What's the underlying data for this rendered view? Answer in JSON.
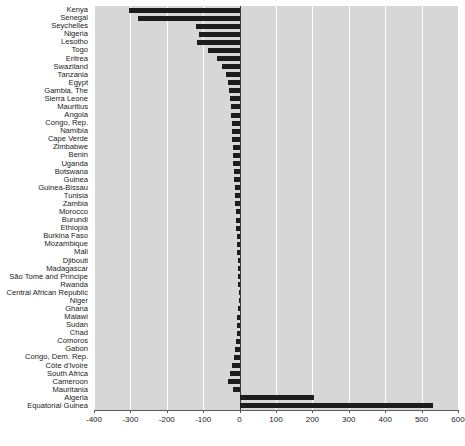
{
  "chart_data": {
    "type": "bar",
    "orientation": "horizontal",
    "title": "",
    "xlabel": "",
    "ylabel": "",
    "xlim": [
      -400,
      600
    ],
    "xticks": [
      -400,
      -300,
      -200,
      -100,
      0,
      100,
      200,
      300,
      400,
      500,
      600
    ],
    "xticklabels": [
      "-400",
      "-300",
      "-200",
      "-100",
      "0",
      "100",
      "200",
      "300",
      "400",
      "500",
      "600"
    ],
    "grid": true,
    "gridlines_on": "x",
    "legend": null,
    "bar_color": "#1c1c1c",
    "plot_background": "#d7d7d7",
    "categories": [
      "Kenya",
      "Senegal",
      "Seychelles",
      "Nigeria",
      "Lesotho",
      "Togo",
      "Eritrea",
      "Swaziland",
      "Tanzania",
      "Egypt",
      "Gambia, The",
      "Sierra Leone",
      "Mauritius",
      "Angola",
      "Congo, Rep.",
      "Namibia",
      "Cape Verde",
      "Zimbabwe",
      "Benin",
      "Uganda",
      "Botswana",
      "Guinea",
      "Guinea-Bissau",
      "Tunisia",
      "Zambia",
      "Morocco",
      "Burundi",
      "Ethiopia",
      "Burkina Faso",
      "Mozambique",
      "Mali",
      "Djibouti",
      "Madagascar",
      "São Tomé and Príncipe",
      "Rwanda",
      "Central African Republic",
      "Niger",
      "Ghana",
      "Malawi",
      "Sudan",
      "Chad",
      "Comoros",
      "Gabon",
      "Congo, Dem. Rep.",
      "Côte d'Ivoire",
      "South Africa",
      "Cameroon",
      "Mauritania",
      "Algeria",
      "Equatorial Guinea"
    ],
    "values": [
      -303,
      -278,
      -119,
      -111,
      -116,
      -86,
      -61,
      -47,
      -36,
      -31,
      -29,
      -27,
      -25,
      -24,
      -22,
      -21,
      -20,
      -19,
      -18,
      -17,
      -16,
      -15,
      -14,
      -13,
      -12,
      -11,
      -10,
      -9,
      -8,
      -7,
      -6,
      -5,
      -5,
      -4,
      -4,
      -3,
      -3,
      -5,
      -6,
      -7,
      -8,
      -10,
      -12,
      -16,
      -20,
      -26,
      -33,
      -18,
      205,
      530
    ]
  }
}
